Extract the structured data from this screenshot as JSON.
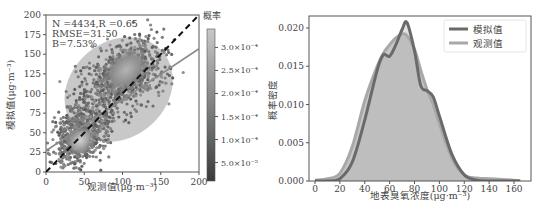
{
  "chart_data": [
    {
      "type": "scatter",
      "title": "",
      "xlabel": "观测值(μg·m⁻³)",
      "ylabel": "模拟值(μg·m⁻³)",
      "xlim": [
        0,
        200
      ],
      "ylim": [
        0,
        200
      ],
      "x_ticks": [
        "0",
        "50",
        "100",
        "150",
        "200"
      ],
      "y_ticks": [
        "0",
        "25",
        "50",
        "75",
        "100",
        "125",
        "150",
        "175",
        "200"
      ],
      "grid": false,
      "stats": {
        "line1": "N =4434,R =0.65",
        "line2": "RMSE=31.50",
        "line3": "B=7.53%"
      },
      "reference_line": {
        "style": "dashed",
        "slope": 1,
        "intercept": 0
      },
      "fit_line": {
        "style": "solid",
        "slope": 0.65,
        "intercept": 27
      },
      "colorbar": {
        "label": "概率",
        "ticks": [
          "5.0×10⁻⁵",
          "1.0×10⁻⁴",
          "1.5×10⁻⁴",
          "2.0×10⁻⁴",
          "2.5×10⁻⁴",
          "3.0×10⁻⁴"
        ],
        "tick_values": [
          5e-05,
          0.0001,
          0.00015,
          0.0002,
          0.00025,
          0.0003
        ],
        "range": [
          1e-05,
          0.00034
        ]
      },
      "density_centers": [
        {
          "x": 45,
          "y": 40,
          "density": 0.00034
        },
        {
          "x": 105,
          "y": 130,
          "density": 0.00025
        }
      ]
    },
    {
      "type": "area",
      "title": "",
      "xlabel": "地表臭氧浓度(μg·m⁻³)",
      "ylabel": "概率密度",
      "xlim": [
        -5,
        172
      ],
      "ylim": [
        0,
        0.0215
      ],
      "x_ticks": [
        "0",
        "20",
        "40",
        "60",
        "80",
        "100",
        "120",
        "140",
        "160"
      ],
      "y_ticks": [
        "0.000",
        "0.005",
        "0.010",
        "0.015",
        "0.020"
      ],
      "grid": false,
      "legend": {
        "position": "upper right",
        "entries": [
          "模拟值",
          "观测值"
        ]
      },
      "x": [
        0,
        10,
        20,
        30,
        40,
        50,
        55,
        60,
        65,
        70,
        74,
        80,
        85,
        90,
        95,
        100,
        110,
        120,
        130,
        140,
        150,
        160,
        165
      ],
      "series": [
        {
          "name": "模拟值",
          "values": [
            0.0,
            0.0,
            0.0003,
            0.0025,
            0.008,
            0.0145,
            0.0165,
            0.0163,
            0.0178,
            0.0198,
            0.0207,
            0.017,
            0.0125,
            0.0118,
            0.011,
            0.0085,
            0.0035,
            0.0008,
            0.0001,
            0.0,
            0.0,
            0.0,
            0.0
          ]
        },
        {
          "name": "观测值",
          "values": [
            0.0001,
            0.0003,
            0.001,
            0.0045,
            0.0105,
            0.015,
            0.0167,
            0.0178,
            0.0187,
            0.0192,
            0.019,
            0.0172,
            0.0145,
            0.012,
            0.01,
            0.0075,
            0.003,
            0.0008,
            0.0004,
            0.0003,
            0.0002,
            0.0001,
            0.0
          ]
        }
      ]
    }
  ],
  "colors": {
    "simulated": "#6a6a6a",
    "observed": "#a8a8a8",
    "fill": "#bdbdbd",
    "axis": "#555555",
    "text": "#444444"
  }
}
